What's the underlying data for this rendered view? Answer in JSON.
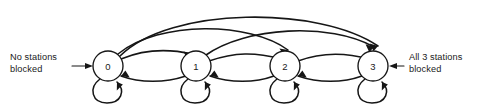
{
  "diagram": {
    "type": "state-transition-diagram",
    "title": "",
    "background_color": "#ffffff",
    "line_color": "#161616",
    "node_fill": "#ffffff",
    "width": 485,
    "height": 107,
    "states": [
      {
        "id": "0",
        "label": "0",
        "cx": 108,
        "cy": 66,
        "r": 15
      },
      {
        "id": "1",
        "label": "1",
        "cx": 196,
        "cy": 66,
        "r": 15
      },
      {
        "id": "2",
        "label": "2",
        "cx": 285,
        "cy": 66,
        "r": 15
      },
      {
        "id": "3",
        "label": "3",
        "cx": 373,
        "cy": 66,
        "r": 15
      }
    ],
    "annotations": [
      {
        "id": "left-annotation",
        "lines": [
          "No stations",
          "blocked"
        ],
        "x": 10,
        "y": 60,
        "anchor": "start",
        "points_to": "0"
      },
      {
        "id": "right-annotation",
        "lines": [
          "All 3 stations",
          "blocked"
        ],
        "x": 409,
        "y": 60,
        "anchor": "start",
        "points_to": "3"
      }
    ],
    "transitions": [
      {
        "id": "t-0-1",
        "from": "0",
        "to": "1",
        "kind": "forward-adjacent"
      },
      {
        "id": "t-1-2",
        "from": "1",
        "to": "2",
        "kind": "forward-adjacent"
      },
      {
        "id": "t-2-3",
        "from": "2",
        "to": "3",
        "kind": "forward-adjacent"
      },
      {
        "id": "t-0-2",
        "from": "0",
        "to": "2",
        "kind": "forward-arc"
      },
      {
        "id": "t-1-3",
        "from": "1",
        "to": "3",
        "kind": "forward-arc"
      },
      {
        "id": "t-0-3",
        "from": "0",
        "to": "3",
        "kind": "forward-arc-outer"
      },
      {
        "id": "t-1-0",
        "from": "1",
        "to": "0",
        "kind": "backward"
      },
      {
        "id": "t-2-1",
        "from": "2",
        "to": "1",
        "kind": "backward"
      },
      {
        "id": "t-3-2",
        "from": "3",
        "to": "2",
        "kind": "backward"
      },
      {
        "id": "t-0-0",
        "from": "0",
        "to": "0",
        "kind": "self-loop"
      },
      {
        "id": "t-1-1",
        "from": "1",
        "to": "1",
        "kind": "self-loop"
      },
      {
        "id": "t-2-2",
        "from": "2",
        "to": "2",
        "kind": "self-loop"
      },
      {
        "id": "t-3-3",
        "from": "3",
        "to": "3",
        "kind": "self-loop"
      }
    ]
  }
}
